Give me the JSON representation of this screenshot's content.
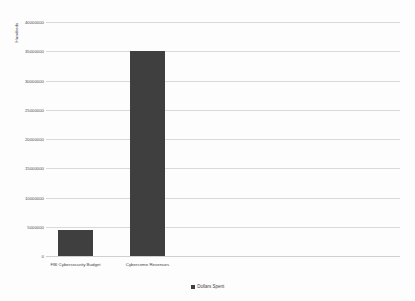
{
  "chart_data": {
    "type": "bar",
    "title": "",
    "subtitle": "",
    "categories": [
      "FBI Cybersecurity Budget",
      "Cybercrime Revenues"
    ],
    "values": [
      4500000,
      35000000
    ],
    "series": [
      {
        "name": "Dollars Spent",
        "values": [
          4500000,
          35000000
        ],
        "color": "#3f3f3f"
      }
    ],
    "xlabel": "",
    "ylabel": "Hundreds",
    "ylim": [
      0,
      40000000
    ],
    "ytick_values": [
      0,
      5000000,
      10000000,
      15000000,
      20000000,
      25000000,
      30000000,
      35000000,
      40000000
    ],
    "ytick_labels": [
      "0",
      "5000000",
      "10000000",
      "15000000",
      "20000000",
      "25000000",
      "30000000",
      "35000000",
      "40000000"
    ],
    "grid": true,
    "grid_axis": "y",
    "legend": {
      "position": "bottom",
      "entries": [
        {
          "label": "Dollars Spent",
          "color": "#3f3f3f",
          "marker": "square-swatch"
        }
      ]
    },
    "colors": {
      "bar": "#3f3f3f",
      "gridline": "#d9d9d9",
      "background": "#fdfdfd",
      "text": "#3f3f3f"
    }
  }
}
